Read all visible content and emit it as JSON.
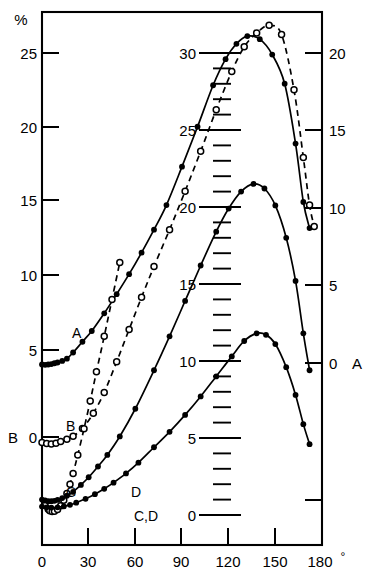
{
  "figure": {
    "unit_label": "%",
    "degree_symbol": "°"
  },
  "axes": {
    "left": {
      "name": "left-axis",
      "series_label": "B",
      "ticks": [
        "25",
        "20",
        "15",
        "10",
        "5",
        "0"
      ],
      "tick_values": [
        25,
        20,
        15,
        10,
        5,
        0
      ]
    },
    "right": {
      "name": "right-axis",
      "series_label": "A",
      "ticks": [
        "20",
        "15",
        "10",
        "5",
        "0"
      ],
      "tick_values": [
        20,
        15,
        10,
        5,
        0
      ]
    },
    "center": {
      "name": "center-axis",
      "series_label": "C,D",
      "ticks": [
        "30",
        "25",
        "20",
        "15",
        "10",
        "5",
        "0"
      ],
      "tick_values": [
        30,
        25,
        20,
        15,
        10,
        5,
        0
      ],
      "minor_step": 1
    },
    "bottom": {
      "name": "angle-axis",
      "ticks": [
        "0",
        "30",
        "60",
        "90",
        "120",
        "150",
        "180"
      ],
      "tick_values": [
        0,
        30,
        60,
        90,
        120,
        150,
        180
      ]
    }
  },
  "curve_labels": {
    "a": "A",
    "b": "B",
    "c": "C",
    "d": "D"
  },
  "chart_data": {
    "type": "line",
    "title": "",
    "xlabel": "",
    "ylabel": "%",
    "xlim": [
      0,
      180
    ],
    "grid": false,
    "legend": "inline-curve-labels",
    "series": [
      {
        "name": "A",
        "axis": "left",
        "marker": "filled-circle",
        "line": "solid",
        "ylim": [
          0,
          27.5
        ],
        "x": [
          0,
          2,
          4,
          6,
          8,
          10,
          13,
          16,
          20,
          26,
          32,
          40,
          48,
          56,
          64,
          72,
          80,
          90,
          100,
          110,
          118,
          125,
          132,
          140,
          148,
          156,
          163,
          168,
          172
        ],
        "y": [
          4.72,
          4.7,
          4.72,
          4.75,
          4.8,
          4.85,
          4.95,
          5.1,
          5.5,
          6.2,
          6.9,
          8.05,
          9.3,
          10.6,
          12.0,
          13.5,
          15.1,
          17.6,
          20.2,
          22.9,
          24.6,
          25.6,
          26.1,
          25.9,
          24.9,
          23.0,
          19.1,
          15.3,
          13.6
        ]
      },
      {
        "name": "B",
        "axis": "left",
        "marker": "open-circle",
        "line": "dashed",
        "ylim": [
          -1.5,
          27.5
        ],
        "x": [
          0,
          3,
          6,
          9,
          12,
          16,
          20,
          26,
          33,
          40,
          48,
          56,
          64,
          72,
          82,
          92,
          102,
          112,
          122,
          130,
          138,
          146,
          154,
          162,
          168,
          172,
          175
        ],
        "y": [
          -0.35,
          -0.42,
          -0.45,
          -0.4,
          -0.3,
          -0.15,
          0.05,
          0.55,
          1.55,
          2.9,
          4.9,
          7.0,
          9.1,
          11.1,
          13.5,
          16.0,
          18.6,
          21.3,
          23.8,
          25.4,
          26.3,
          26.8,
          26.2,
          22.6,
          18.2,
          15.1,
          13.7
        ]
      },
      {
        "name": "C",
        "axis": "center",
        "marker": "open-circle",
        "line": "dashed",
        "ylim": [
          0,
          31
        ],
        "x": [
          2,
          4,
          5,
          6.5,
          8,
          10,
          12,
          14,
          16,
          18,
          20,
          23,
          27,
          31,
          35,
          40,
          45,
          50
        ],
        "y": [
          0.62,
          0.38,
          0.28,
          0.22,
          0.24,
          0.35,
          0.6,
          0.95,
          1.4,
          2.0,
          2.7,
          3.9,
          5.6,
          7.4,
          9.3,
          11.6,
          14.0,
          16.4
        ]
      },
      {
        "name": "D",
        "axis": "center",
        "marker": "filled-circle",
        "line": "solid",
        "ylim": [
          0,
          22
        ],
        "x": [
          0,
          2,
          4,
          6,
          8,
          10,
          13,
          16,
          20,
          25,
          30,
          36,
          42,
          50,
          60,
          72,
          82,
          92,
          102,
          112,
          120,
          128,
          136,
          143,
          150,
          157,
          163,
          168,
          172
        ],
        "y": [
          1.0,
          0.95,
          0.9,
          0.9,
          0.92,
          0.98,
          1.1,
          1.25,
          1.5,
          1.95,
          2.45,
          3.15,
          3.9,
          5.1,
          6.9,
          9.4,
          11.6,
          13.9,
          16.2,
          18.4,
          19.9,
          21.0,
          21.5,
          21.2,
          20.1,
          18.0,
          15.2,
          11.8,
          9.4
        ]
      },
      {
        "name": "E",
        "axis": "center",
        "marker": "filled-circle",
        "line": "solid",
        "ylim": [
          0,
          14
        ],
        "x": [
          0,
          3,
          6,
          10,
          14,
          18,
          22,
          28,
          34,
          40,
          46,
          54,
          62,
          72,
          82,
          92,
          102,
          112,
          122,
          130,
          138,
          144,
          150,
          157,
          163,
          168,
          172
        ],
        "y": [
          0.55,
          0.5,
          0.48,
          0.5,
          0.56,
          0.66,
          0.8,
          1.05,
          1.35,
          1.7,
          2.1,
          2.7,
          3.4,
          4.4,
          5.4,
          6.5,
          7.7,
          9.0,
          10.3,
          11.3,
          11.8,
          11.7,
          11.1,
          9.6,
          7.8,
          5.9,
          4.6
        ]
      }
    ]
  }
}
